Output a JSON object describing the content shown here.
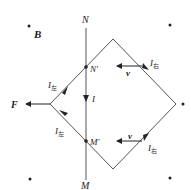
{
  "diagram": {
    "type": "physics-electromagnetic-induction",
    "field_label": "B",
    "field_dots": [
      [
        29,
        26
      ],
      [
        170,
        25
      ],
      [
        183,
        104
      ],
      [
        30,
        179
      ],
      [
        170,
        178
      ]
    ],
    "rod": {
      "top_label": "N",
      "bottom_label": "M",
      "top_contact_label": "N′",
      "bottom_contact_label": "M′",
      "current_label": "I"
    },
    "loop_vertices": {
      "top": [
        113,
        39
      ],
      "right": [
        176,
        104
      ],
      "bottom": [
        113,
        169
      ],
      "left": [
        50,
        104
      ]
    },
    "force_label": "F",
    "velocity_label": "v",
    "currents": {
      "left_upper": {
        "main": "I",
        "sub": "左"
      },
      "left_lower": {
        "main": "I",
        "sub": "左"
      },
      "right_upper": {
        "main": "I",
        "sub": "右"
      },
      "right_lower": {
        "main": "I",
        "sub": "右"
      }
    },
    "colors": {
      "line": "#555555",
      "text": "#1a1a1a",
      "background": "#ffffff"
    }
  }
}
